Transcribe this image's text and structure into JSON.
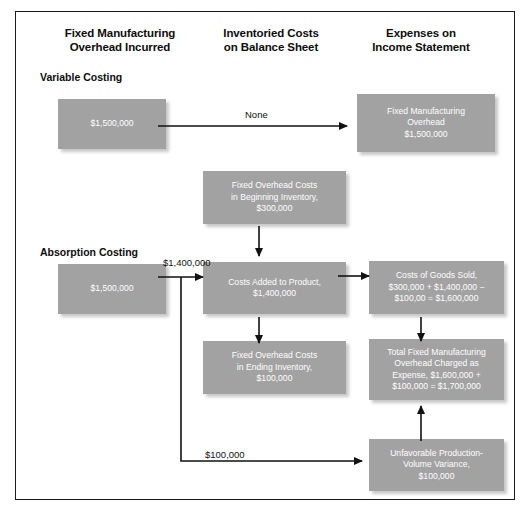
{
  "diagram": {
    "columns": [
      {
        "line1": "Fixed Manufacturing",
        "line2": "Overhead Incurred"
      },
      {
        "line1": "Inventoried Costs",
        "line2": "on Balance Sheet"
      },
      {
        "line1": "Expenses on",
        "line2": "Income Statement"
      }
    ],
    "sections": [
      {
        "label": "Variable Costing"
      },
      {
        "label": "Absorption Costing"
      }
    ],
    "boxes": {
      "vc_overhead_incurred": {
        "lines": [
          "$1,500,000"
        ]
      },
      "vc_expense": {
        "lines": [
          "Fixed Manufacturing",
          "Overhead",
          "$1,500,000"
        ]
      },
      "ac_overhead_incurred": {
        "lines": [
          "$1,500,000"
        ]
      },
      "beginning_inventory": {
        "lines": [
          "Fixed Overhead Costs",
          "in Beginning Inventory,",
          "$300,000"
        ]
      },
      "costs_added": {
        "lines": [
          "Costs Added to Product,",
          "$1,400,000"
        ]
      },
      "ending_inventory": {
        "lines": [
          "Fixed Overhead Costs",
          "in Ending Inventory,",
          "$100,000"
        ]
      },
      "cogs": {
        "lines": [
          "Costs of Goods Sold,",
          "$300,000 + $1,400,000 −",
          "$100,00 = $1,600,000"
        ]
      },
      "total_fixed_oh": {
        "lines": [
          "Total Fixed Manufacturing",
          "Overhead Charged as",
          "Expense, $1,600,000 +",
          "$100,000 = $1,700,000"
        ]
      },
      "pv_variance": {
        "lines": [
          "Unfavorable Production-",
          "Volume Variance,",
          "$100,000"
        ]
      }
    },
    "edge_labels": {
      "vc_none": "None",
      "ac_to_costs_added": "$1,400,000",
      "ac_to_variance": "$100,000"
    },
    "colors": {
      "box_fill": "#a2a2a2",
      "box_text": "#ffffff",
      "frame_border": "#1b1b1b",
      "arrow": "#111111",
      "background": "#ffffff"
    }
  }
}
